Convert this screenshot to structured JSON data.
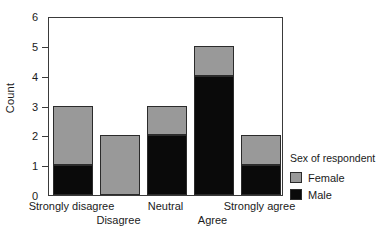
{
  "chart_data": {
    "type": "bar",
    "subtype": "stacked",
    "title": "",
    "xlabel": "",
    "ylabel": "Count",
    "ylim": [
      0,
      6
    ],
    "yticks": [
      0,
      1,
      2,
      3,
      4,
      5,
      6
    ],
    "ytick_labels": [
      "0",
      "1",
      "2",
      "3",
      "4",
      "5",
      "6"
    ],
    "grid": false,
    "categories": [
      "Strongly disagree",
      "Disagree",
      "Neutral",
      "Agree",
      "Strongly agree"
    ],
    "series": [
      {
        "name": "Male",
        "color": "#0a0a0a",
        "values": [
          1,
          0,
          2,
          4,
          1
        ]
      },
      {
        "name": "Female",
        "color": "#999999",
        "values": [
          2,
          2,
          1,
          1,
          1
        ]
      }
    ],
    "totals": [
      3,
      2,
      3,
      5,
      2
    ],
    "legend": {
      "title": "Sex of respondent",
      "position": "right",
      "entries": [
        {
          "label": "Female",
          "color": "#999999"
        },
        {
          "label": "Male",
          "color": "#0a0a0a"
        }
      ]
    },
    "xtick_rows": [
      {
        "row": 0,
        "labels": [
          "Strongly disagree",
          "Neutral",
          "Strongly agree"
        ]
      },
      {
        "row": 1,
        "labels": [
          "Disagree",
          "Agree"
        ]
      }
    ]
  },
  "axes": {
    "y_title": "Count",
    "y_labels": [
      "6",
      "5",
      "4",
      "3",
      "2",
      "1",
      "0"
    ],
    "x_labels_row1": [
      "Strongly disagree",
      "Neutral",
      "Strongly agree"
    ],
    "x_labels_row2": [
      "Disagree",
      "Agree"
    ]
  },
  "legend": {
    "title": "Sex of respondent",
    "female_label": "Female",
    "male_label": "Male"
  },
  "colors": {
    "female": "#999999",
    "male": "#0a0a0a",
    "frame": "#3a3a3a",
    "background": "#ffffff"
  }
}
